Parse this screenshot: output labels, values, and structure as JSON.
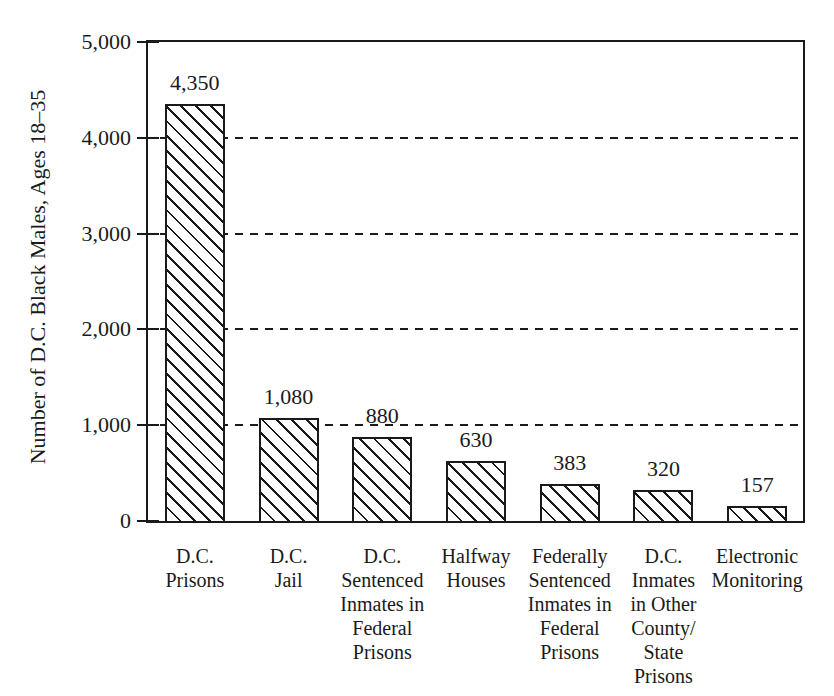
{
  "figure": {
    "ink_color": "#1a1a1a",
    "paper_color": "#ffffff",
    "bar_fill_pattern": "diagonal-hatch-backslash"
  },
  "chart_data": {
    "type": "bar",
    "title": "",
    "xlabel": "",
    "ylabel": "Number of D.C. Black Males, Ages 18–35",
    "ylim": [
      0,
      5000
    ],
    "ytick_interval": 1000,
    "ytick_labels": [
      "0",
      "1,000",
      "2,000",
      "3,000",
      "4,000",
      "5,000"
    ],
    "grid": "horizontal dashed lines at 1,000 through 4,000",
    "legend": "none",
    "categories": [
      "D.C.\nPrisons",
      "D.C.\nJail",
      "D.C.\nSentenced\nInmates in\nFederal\nPrisons",
      "Halfway\nHouses",
      "Federally\nSentenced\nInmates in\nFederal\nPrisons",
      "D.C.\nInmates\nin Other\nCounty/\nState\nPrisons",
      "Electronic\nMonitoring"
    ],
    "values": [
      4350,
      1080,
      880,
      630,
      383,
      320,
      157
    ],
    "value_labels": [
      "4,350",
      "1,080",
      "880",
      "630",
      "383",
      "320",
      "157"
    ]
  }
}
